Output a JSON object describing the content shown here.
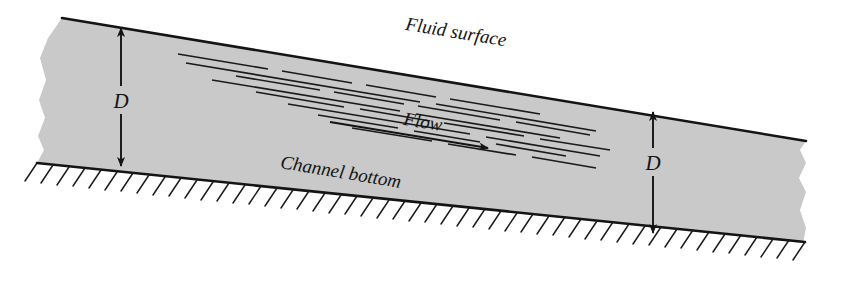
{
  "figure": {
    "type": "engineering-diagram",
    "background_color": "#ffffff",
    "fluid_fill_color": "#c9c9c9",
    "line_color": "#141414",
    "slope_degrees": 9.5
  },
  "labels": {
    "fluid_surface": "Fluid surface",
    "flow": "Flow",
    "channel_bottom": "Channel bottom",
    "depth_left": "D",
    "depth_right": "D"
  },
  "annotations": {
    "depth_left_arrow": "double-headed vertical arrow from fluid surface to channel bottom",
    "depth_right_arrow": "double-headed vertical arrow from fluid surface to channel bottom",
    "flow_arrow": "arrow pointing downslope to the right",
    "hatching": "ground hatch marks below channel bottom",
    "streaks": "dashed streamline ticks beneath the fluid surface",
    "left_edge": "torn/broken boundary",
    "right_edge": "torn/broken boundary"
  },
  "geometry": {
    "surface_line": {
      "x1": 62,
      "y1": 18,
      "x2": 806,
      "y2": 141
    },
    "bottom_line": {
      "x1": 37,
      "y1": 163,
      "x2": 806,
      "y2": 243
    },
    "depth_left_arrow": {
      "x": 121,
      "y_top": 27,
      "y_bottom": 167
    },
    "depth_right_arrow": {
      "x": 653,
      "y_top": 111,
      "y_bottom": 234
    },
    "flow_arrow": {
      "x1": 330,
      "y1": 123,
      "x2": 490,
      "y2": 148
    }
  }
}
